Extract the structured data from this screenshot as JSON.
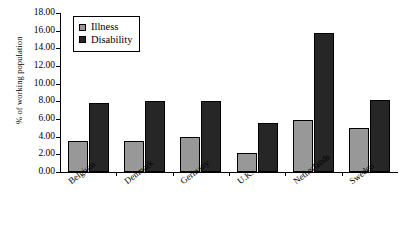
{
  "chart_data": {
    "type": "bar",
    "title": "",
    "xlabel": "",
    "ylabel": "% of working population",
    "categories": [
      "Belgium",
      "Denmark",
      "Germany",
      "U.K.",
      "Netherlands",
      "Sweden"
    ],
    "series": [
      {
        "name": "Illness",
        "color": "#989898",
        "values": [
          3.5,
          3.5,
          4.0,
          2.1,
          5.9,
          5.0
        ]
      },
      {
        "name": "Disability",
        "color": "#262626",
        "values": [
          7.8,
          8.0,
          8.0,
          5.6,
          15.7,
          8.2
        ]
      }
    ],
    "ylim": [
      0,
      18
    ],
    "ytick_step": 2,
    "ytick_labels": [
      "0.00",
      "2.00",
      "4.00",
      "6.00",
      "8.00",
      "10.00",
      "12.00",
      "14.00",
      "16.00",
      "18.00"
    ],
    "grid": false,
    "legend_position": "upper-left-inside",
    "axis_color": "#000000",
    "background": "#ffffff"
  }
}
